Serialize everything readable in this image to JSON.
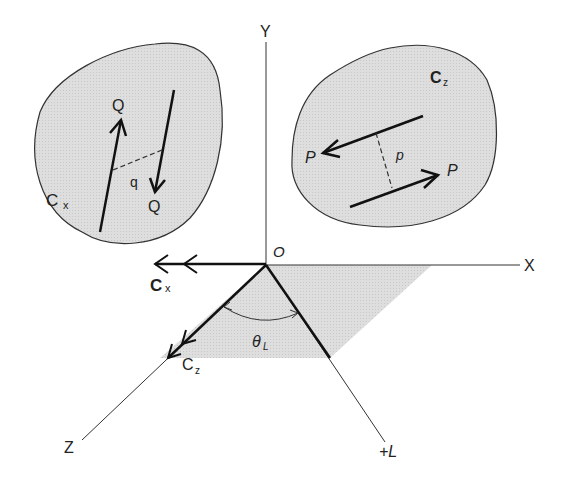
{
  "diagram": {
    "type": "3d-coordinate-couples",
    "axes": {
      "y_label": "Y",
      "x_label": "X",
      "z_label": "Z",
      "l_label": "+L",
      "origin_label": "O"
    },
    "left_body": {
      "couple_label": "C",
      "couple_subscript": "x",
      "force_top_label": "Q",
      "force_bottom_label": "Q",
      "arm_label": "q"
    },
    "right_body": {
      "couple_label": "C",
      "couple_subscript": "z",
      "force_left_label": "P",
      "force_right_label": "P",
      "arm_label": "p"
    },
    "vectors": {
      "cx_label": "C",
      "cx_subscript": "x",
      "cz_label": "C",
      "cz_subscript": "z",
      "angle_label": "θ",
      "angle_subscript": "L"
    },
    "colors": {
      "body_fill": "#dcdcdc",
      "plane_fill": "#e2e2e2",
      "line": "#1a1a1a"
    }
  }
}
